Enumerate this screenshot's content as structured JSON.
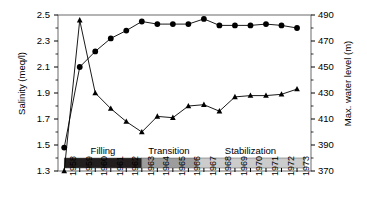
{
  "chart_data": {
    "type": "line",
    "title": "",
    "xlabel": "",
    "ylabel": "Salinity (meq/l)",
    "ylabel_right": "Max. water level (m)",
    "grid": false,
    "legend_position": "none",
    "x": [
      1958,
      1959,
      1960,
      1961,
      1962,
      1963,
      1964,
      1965,
      1966,
      1967,
      1968,
      1969,
      1970,
      1971,
      1972,
      1973
    ],
    "categories": [
      "1958",
      "1959",
      "1960",
      "1961",
      "1962",
      "1963",
      "1964",
      "1965",
      "1966",
      "1967",
      "1968",
      "1969",
      "1970",
      "1971",
      "1972",
      "1973"
    ],
    "ylim": [
      1.3,
      2.5
    ],
    "yticks": [
      1.3,
      1.5,
      1.7,
      1.9,
      2.1,
      2.3,
      2.5
    ],
    "ytick_labels": [
      "1.3",
      "1.5",
      "1.7",
      "1.9",
      "2.1",
      "2.3",
      "2.5"
    ],
    "ylim_right": [
      370,
      490
    ],
    "yticks_right": [
      370,
      390,
      410,
      430,
      450,
      470,
      490
    ],
    "ytick_labels_right": [
      "370",
      "390",
      "410",
      "430",
      "450",
      "470",
      "490"
    ],
    "series": [
      {
        "name": "Salinity",
        "axis": "left",
        "marker": "circle",
        "color": "#000000",
        "values": [
          1.48,
          2.1,
          2.22,
          2.32,
          2.38,
          2.45,
          2.43,
          2.43,
          2.43,
          2.47,
          2.42,
          2.42,
          2.42,
          2.43,
          2.42,
          2.4
        ]
      },
      {
        "name": "Max. water level",
        "axis": "right",
        "marker": "triangle",
        "color": "#000000",
        "values": [
          370,
          486,
          430,
          418,
          408,
          400,
          412,
          411,
          420,
          421,
          416,
          427,
          428,
          428,
          429,
          433
        ]
      }
    ],
    "phase_bands": [
      {
        "label": "Filling",
        "start": 1958,
        "end": 1963.0,
        "color": "#231f1e"
      },
      {
        "label": "Transition",
        "start": 1963.0,
        "end": 1966.5,
        "color": "#9d9d9d"
      },
      {
        "label": "Stabilization",
        "start": 1966.5,
        "end": 1973.5,
        "color": "#cccccc"
      }
    ]
  },
  "axes": {
    "left_title": "Salinity (meq/l)",
    "right_title": "Max. water level (m)"
  }
}
